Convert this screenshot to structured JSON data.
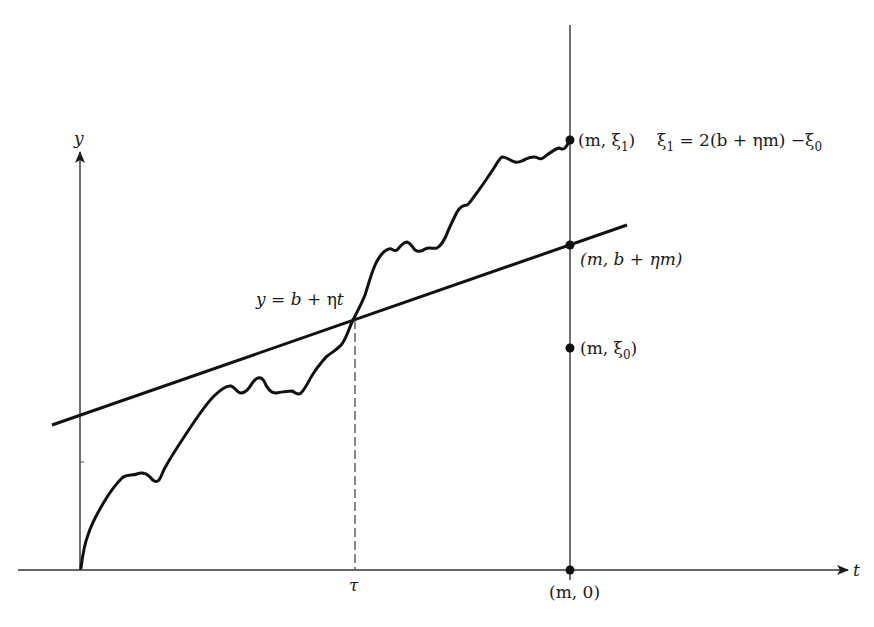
{
  "figure": {
    "type": "Brownian path crossing a linear boundary (reflection principle)",
    "axes": {
      "y_label": "y",
      "t_label": "t"
    },
    "line": {
      "equation_label": "y = b + ηt",
      "lhs": "y",
      "eq": " = ",
      "b": "b",
      "plus": " + ",
      "eta": "η",
      "t": "t"
    },
    "crossing": {
      "label": "τ"
    },
    "points": [
      {
        "id": "xi1",
        "label_prefix": "(m, ξ",
        "sub": "1",
        "label_suffix": ")",
        "note_prefix": "ξ",
        "note_sub": "1",
        "note_mid": " = 2(b + ηm) −ξ",
        "note_sub2": "0"
      },
      {
        "id": "boundary",
        "label": "(m, b + ηm)"
      },
      {
        "id": "xi0",
        "label_prefix": "(m, ξ",
        "sub": "0",
        "label_suffix": ")"
      },
      {
        "id": "origin_m",
        "label": "(m, 0)"
      }
    ],
    "colors": {
      "ink": "#1a1a1a",
      "background": "#ffffff"
    }
  }
}
